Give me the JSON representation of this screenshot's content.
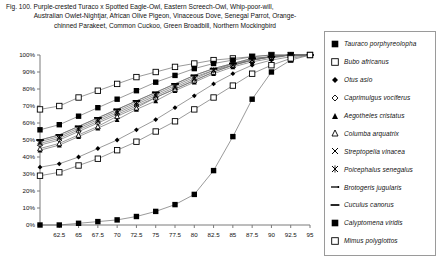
{
  "figure": {
    "caption_lines": [
      "Fig. 100.  Purple-crested Turaco x Spotted Eagle-Owl, Eastern Screech-Owl, Whip-poor-will,",
      "Australian Owlet-Nightjar, African Olive Pigeon, Vinaceous Dove, Senegal Parrot, Orange-",
      "chinned Parakeet, Common Cuckoo, Green Broadbill, Northern Mockingbird"
    ]
  },
  "chart_data": {
    "type": "line",
    "title": "",
    "xlabel": "",
    "ylabel": "",
    "xlim": [
      60,
      95
    ],
    "ylim": [
      0,
      100
    ],
    "grid": false,
    "legend_position": "right",
    "x": [
      60,
      62.5,
      65,
      67.5,
      70,
      72.5,
      75,
      77.5,
      80,
      82.5,
      85,
      87.5,
      90,
      92.5,
      95
    ],
    "xtick_labels": [
      "62.5",
      "65",
      "67.5",
      "70",
      "72.5",
      "75",
      "77.5",
      "80",
      "82.5",
      "85",
      "87.5",
      "90",
      "92.5",
      "95"
    ],
    "ytick_labels": [
      "0%",
      "10%",
      "20%",
      "30%",
      "40%",
      "50%",
      "60%",
      "70%",
      "80%",
      "90%",
      "100%"
    ],
    "series": [
      {
        "name": "Tauraco porphyreolopha",
        "marker": "filled-square",
        "values": [
          0,
          0,
          1,
          2,
          3,
          5,
          8,
          12,
          18,
          32,
          52,
          74,
          90,
          97,
          100
        ]
      },
      {
        "name": "Bubo africanus",
        "marker": "open-square",
        "values": [
          68,
          70,
          75,
          79,
          83,
          87,
          90,
          93,
          95,
          97,
          98,
          99,
          100,
          100,
          100
        ]
      },
      {
        "name": "Otus asio",
        "marker": "filled-diamond",
        "values": [
          34,
          36,
          40,
          45,
          50,
          56,
          62,
          69,
          76,
          83,
          89,
          94,
          97,
          99,
          100
        ]
      },
      {
        "name": "Caprimulgus vociferus",
        "marker": "open-diamond",
        "values": [
          47,
          50,
          55,
          60,
          65,
          70,
          75,
          80,
          85,
          90,
          94,
          97,
          99,
          100,
          100
        ]
      },
      {
        "name": "Aegotheles cristatus",
        "marker": "filled-triangle",
        "values": [
          44,
          47,
          52,
          57,
          62,
          68,
          73,
          79,
          84,
          89,
          93,
          96,
          98,
          100,
          100
        ]
      },
      {
        "name": "Columba arquatrix",
        "marker": "open-triangle",
        "values": [
          45,
          48,
          53,
          58,
          64,
          69,
          75,
          80,
          85,
          90,
          94,
          97,
          99,
          100,
          100
        ]
      },
      {
        "name": "Streptopelia vinacea",
        "marker": "x-cross",
        "values": [
          49,
          52,
          57,
          62,
          67,
          72,
          77,
          82,
          87,
          91,
          95,
          97,
          99,
          100,
          100
        ]
      },
      {
        "name": "Poicephalus senegalus",
        "marker": "star-cross",
        "values": [
          48,
          51,
          56,
          61,
          66,
          71,
          76,
          81,
          86,
          91,
          94,
          97,
          99,
          100,
          100
        ]
      },
      {
        "name": "Brotogeris jugularis",
        "marker": "dash-dot",
        "values": [
          50,
          53,
          58,
          63,
          68,
          73,
          78,
          83,
          88,
          92,
          95,
          98,
          99,
          100,
          100
        ]
      },
      {
        "name": "Cuculus canorus",
        "marker": "dash",
        "values": [
          50,
          53,
          58,
          63,
          68,
          73,
          78,
          83,
          88,
          92,
          95,
          98,
          99,
          100,
          100
        ]
      },
      {
        "name": "Calyptomena viridis",
        "marker": "filled-square",
        "values": [
          56,
          59,
          64,
          69,
          74,
          79,
          84,
          88,
          92,
          95,
          97,
          99,
          100,
          100,
          100
        ]
      },
      {
        "name": "Mimus polyglottos",
        "marker": "open-square",
        "values": [
          29,
          31,
          35,
          39,
          44,
          49,
          55,
          61,
          68,
          75,
          82,
          89,
          94,
          98,
          100
        ]
      }
    ]
  },
  "legend": {
    "items": [
      {
        "label": "Tauraco porphyreolopha",
        "marker": "filled-square"
      },
      {
        "label": "Bubo africanus",
        "marker": "open-square"
      },
      {
        "label": "Otus asio",
        "marker": "filled-diamond"
      },
      {
        "label": "Caprimulgus vociferus",
        "marker": "open-diamond"
      },
      {
        "label": "Aegotheles cristatus",
        "marker": "filled-triangle"
      },
      {
        "label": "Columba arquatrix",
        "marker": "open-triangle"
      },
      {
        "label": "Streptopelia vinacea",
        "marker": "x-cross"
      },
      {
        "label": "Poicephalus senegalus",
        "marker": "star-cross"
      },
      {
        "label": "Brotogeris jugularis",
        "marker": "dash-dot"
      },
      {
        "label": "Cuculus canorus",
        "marker": "dash"
      },
      {
        "label": "Calyptomena viridis",
        "marker": "filled-square"
      },
      {
        "label": "Mimus polyglottos",
        "marker": "open-square"
      }
    ]
  }
}
